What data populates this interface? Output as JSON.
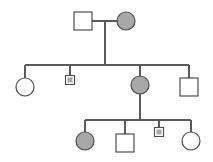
{
  "figure": {
    "type": "pedigree-chart",
    "title": "",
    "width": 213,
    "height": 162,
    "background_color": "#ffffff",
    "line_color": "#5a5a5a",
    "outline_color": "#4d4d4d",
    "affected_fill_color": "#a8a8a8",
    "unaffected_fill_color": "#ffffff"
  },
  "legend": {
    "square_meaning": "male",
    "circle_meaning": "female",
    "shaded_meaning": "affected",
    "open_meaning": "unaffected",
    "small_shaded_square_meaning": "affected male (small symbol)"
  },
  "chart_data": {
    "type": "diagram",
    "generations": [
      {
        "id": "I",
        "label": "I",
        "individuals": [
          {
            "id": "I-1",
            "shape": "square",
            "sex": "male",
            "affected": false,
            "size": "normal",
            "cx": 83,
            "cy": 21,
            "w": 18,
            "h": 18
          },
          {
            "id": "I-2",
            "shape": "circle",
            "sex": "female",
            "affected": true,
            "size": "normal",
            "cx": 126,
            "cy": 21,
            "r": 9
          }
        ]
      },
      {
        "id": "II",
        "label": "II",
        "individuals": [
          {
            "id": "II-1",
            "shape": "circle",
            "sex": "female",
            "affected": false,
            "size": "normal",
            "cx": 25,
            "cy": 87,
            "r": 9
          },
          {
            "id": "II-2",
            "shape": "square",
            "sex": "male",
            "affected": true,
            "size": "small",
            "cx": 70,
            "cy": 80,
            "w": 9,
            "h": 9
          },
          {
            "id": "II-3",
            "shape": "circle",
            "sex": "female",
            "affected": true,
            "size": "normal",
            "cx": 140,
            "cy": 85,
            "r": 9
          },
          {
            "id": "II-4",
            "shape": "square",
            "sex": "male",
            "affected": false,
            "size": "normal",
            "cx": 189,
            "cy": 87,
            "w": 18,
            "h": 18
          }
        ]
      },
      {
        "id": "III",
        "label": "III",
        "individuals": [
          {
            "id": "III-1",
            "shape": "circle",
            "sex": "female",
            "affected": true,
            "size": "normal",
            "cx": 85,
            "cy": 141,
            "r": 9
          },
          {
            "id": "III-2",
            "shape": "square",
            "sex": "male",
            "affected": false,
            "size": "normal",
            "cx": 125,
            "cy": 143,
            "w": 18,
            "h": 18
          },
          {
            "id": "III-3",
            "shape": "square",
            "sex": "male",
            "affected": true,
            "size": "small",
            "cx": 159,
            "cy": 132,
            "w": 9,
            "h": 9
          },
          {
            "id": "III-4",
            "shape": "circle",
            "sex": "female",
            "affected": false,
            "size": "normal",
            "cx": 191,
            "cy": 141,
            "r": 9
          }
        ]
      }
    ],
    "matings": [
      {
        "id": "mating-I",
        "partners": [
          "I-1",
          "I-2"
        ],
        "line_y": 21,
        "x_start": 92,
        "x_end": 117,
        "descent_x": 105,
        "descent_y_end": 65
      },
      {
        "id": "mating-II",
        "partners": [
          "II-3"
        ],
        "descent_x": 140,
        "descent_y_start": 65,
        "descent_y_end": 120
      }
    ],
    "sibships": [
      {
        "id": "sibship-II",
        "parents": [
          "I-1",
          "I-2"
        ],
        "children": [
          "II-1",
          "II-2",
          "II-3",
          "II-4"
        ],
        "line_y": 65,
        "x_start": 25,
        "x_end": 189,
        "drops": [
          {
            "child": "II-1",
            "x": 25,
            "y_end": 78
          },
          {
            "child": "II-2",
            "x": 70,
            "y_end": 76
          },
          {
            "child": "II-3",
            "x": 140,
            "y_end": 76
          },
          {
            "child": "II-4",
            "x": 189,
            "y_end": 78
          }
        ]
      },
      {
        "id": "sibship-III",
        "parents": [
          "II-3"
        ],
        "children": [
          "III-1",
          "III-2",
          "III-3",
          "III-4"
        ],
        "line_y": 120,
        "x_start": 85,
        "x_end": 191,
        "drops": [
          {
            "child": "III-1",
            "x": 85,
            "y_end": 132
          },
          {
            "child": "III-2",
            "x": 125,
            "y_end": 134
          },
          {
            "child": "III-3",
            "x": 159,
            "y_end": 128
          },
          {
            "child": "III-4",
            "x": 191,
            "y_end": 132
          }
        ]
      }
    ],
    "counts": {
      "total_individuals": 10,
      "affected_individuals": 5,
      "unaffected_individuals": 5,
      "males": 5,
      "females": 5,
      "generations": 3
    }
  }
}
